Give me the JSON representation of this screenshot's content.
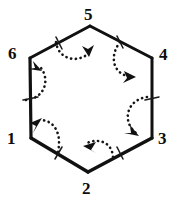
{
  "figure": {
    "shape": "hexagon",
    "stroke_color": "#111111",
    "background_color": "#ffffff",
    "label_color": "#0d0d0d",
    "vertices": [
      {
        "id": "v1",
        "label": "1",
        "x": 31,
        "y": 138,
        "label_x": 7,
        "label_y": 130
      },
      {
        "id": "v2",
        "label": "2",
        "x": 88,
        "y": 172,
        "label_x": 82,
        "label_y": 180
      },
      {
        "id": "v3",
        "label": "3",
        "x": 152,
        "y": 138,
        "label_x": 158,
        "label_y": 130
      },
      {
        "id": "v4",
        "label": "4",
        "x": 152,
        "y": 58,
        "label_x": 159,
        "label_y": 46
      },
      {
        "id": "v5",
        "label": "5",
        "x": 90,
        "y": 26,
        "label_x": 84,
        "label_y": 6
      },
      {
        "id": "v6",
        "label": "6",
        "x": 30,
        "y": 58,
        "label_x": 8,
        "label_y": 45
      }
    ],
    "edges": [
      {
        "id": "e1",
        "from": "v1",
        "to": "v2",
        "tick_mark": true
      },
      {
        "id": "e2",
        "from": "v2",
        "to": "v3",
        "tick_mark": true
      },
      {
        "id": "e3",
        "from": "v3",
        "to": "v4",
        "tick_mark": true
      },
      {
        "id": "e4",
        "from": "v4",
        "to": "v5",
        "tick_mark": true
      },
      {
        "id": "e5",
        "from": "v5",
        "to": "v6",
        "tick_mark": true
      },
      {
        "id": "e6",
        "from": "v6",
        "to": "v1",
        "tick_mark": true
      }
    ],
    "arcs": [
      {
        "id": "a1",
        "at_vertex": "v1",
        "style": "dotted",
        "arrowhead": "at-start",
        "direction": "counterclockwise"
      },
      {
        "id": "a2",
        "at_vertex": "v2",
        "style": "dotted",
        "arrowhead": "at-start",
        "direction": "counterclockwise"
      },
      {
        "id": "a3",
        "at_vertex": "v3",
        "style": "dotted",
        "arrowhead": "at-start",
        "direction": "counterclockwise"
      },
      {
        "id": "a4",
        "at_vertex": "v4",
        "style": "dotted",
        "arrowhead": "at-start",
        "direction": "counterclockwise"
      },
      {
        "id": "a5",
        "at_vertex": "v5",
        "style": "dotted",
        "arrowhead": "at-start",
        "direction": "counterclockwise"
      },
      {
        "id": "a6",
        "at_vertex": "v6",
        "style": "dotted",
        "arrowhead": "at-start",
        "direction": "counterclockwise"
      }
    ]
  }
}
